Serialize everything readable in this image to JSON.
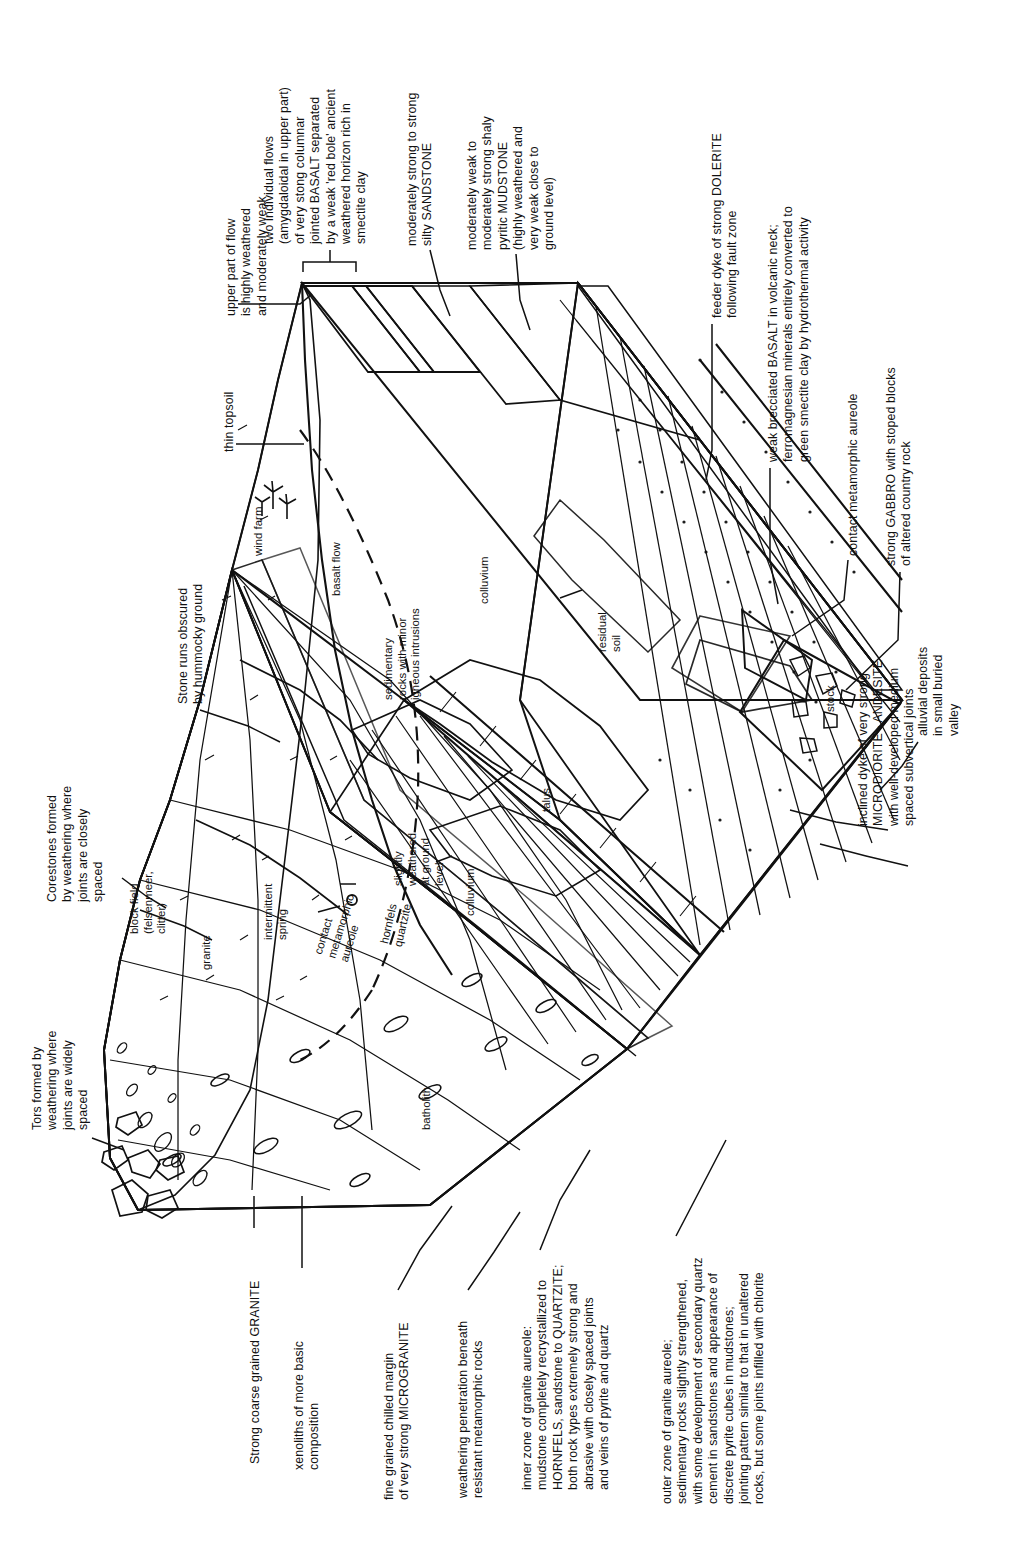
{
  "figure": {
    "type": "geological-block-diagram",
    "orientation": "rotated-90-ccw",
    "background_color": "#ffffff",
    "line_color": "#111111",
    "title": ""
  },
  "callouts": {
    "upper_part_of_flow": "upper part of flow\nis highly weathered\nand moderately weak",
    "two_individual_flows": "two individual flows\n(amygdaloidal in upper part)\nof very stong columnar\njointed BASALT separated\nby a weak 'red bole' ancient\nweathered horizon rich in\nsmectite clay",
    "sandstone": "moderately strong to strong\nsilty SANDSTONE",
    "mudstone": "moderately weak to\nmoderately strong shaly\npyritic MUDSTONE\n(highly weathered and\nvery weak close to\nground level)",
    "thin_topsoil": "thin topsoil",
    "dolerite": "feeder dyke of strong DOLERITE\nfollowing fault zone",
    "brecciated_basalt": "weak brecciated BASALT in volcanic neck;\nferromagnesian minerals entirely converted to\ngreen smectite clay by hydrothermal activity",
    "contact_aureole": "contact metamorphic aureole",
    "gabbro": "strong GABBRO with stoped blocks\nof altered country rock",
    "alluvial": "alluvial deposits\nin small buried\nvalley",
    "microdiorite": "inclined dyke of very strong\nMICRODIORITE - ANDESITE\nwith well-developed medium\nspaced subvertical joints",
    "corestones": "Corestones formed\nby weathering where\njoints are closely\nspaced",
    "tors": "Tors formed by\nweathering where\njoints are widely\nspaced",
    "stone_runs": "Stone runs obscured\nby hummocky ground",
    "granite_strong": "Strong coarse grained GRANITE",
    "xenoliths": "xenoliths of more basic\ncomposition",
    "microgranite": "fine grained chilled margin\nof very strong MICROGRANITE",
    "weathering_penetration": "weathering penetration beneath\nresistant metamorphic rocks",
    "inner_aureole": "inner zone of granite aureole:\nmudstone completely recrystallized to\nHORNFELS, sandstone to QUARTZITE;\nboth rock types extremely strong and\nabrasive with closely spaced joints\nand veins of pyrite and quartz",
    "outer_aureole": "outer zone of granite aureole;\nsedimentary rocks slightly strengthened,\nwith some development of secondary quartz\ncement in sandstones and appearance of\ndiscrete pyrite cubes in mudstones;\njointing pattern similar to that in unaltered\nrocks, but some joints infilled with chlorite"
  },
  "interior_labels": {
    "wind_farm": "wind farm",
    "basalt_flow": "basalt flow",
    "block_field": "block field\n(felsenmeer,\nclitter)",
    "granite": "granite",
    "intermittent_spring": "intermittent\nspring",
    "contact_metamorphic_aureole": "contact\nmetamorphic\naureole",
    "hornfels_quartzite": "hornfels\nquartzite",
    "slightly_weathered": "slightly\nweathered\nat ground\nlevel",
    "sedimentary_rocks": "sedimentary\nrocks with minor\nigneous intrusions",
    "colluvium_upper": "colluvium",
    "colluvium_mid": "colluvium",
    "colluvium_lower": "colluvium",
    "talus": "talus",
    "residual_soil": "residual\nsoil",
    "stock": "stock",
    "batholith": "batholith"
  }
}
